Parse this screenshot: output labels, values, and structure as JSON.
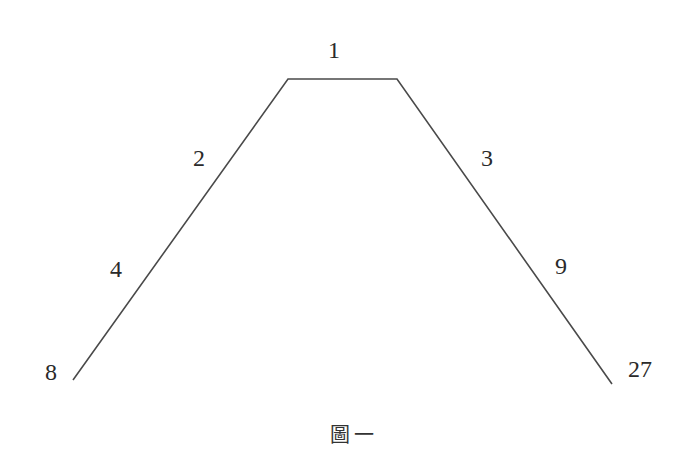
{
  "figure": {
    "caption": "圖一",
    "stroke_color": "#4a4a4a",
    "path_points": [
      [
        73,
        380
      ],
      [
        288,
        79
      ],
      [
        397,
        79
      ],
      [
        612,
        384
      ]
    ],
    "labels": {
      "top": "1",
      "left_upper": "2",
      "right_upper": "3",
      "left_middle": "4",
      "right_middle": "9",
      "left_end": "8",
      "right_end": "27"
    }
  }
}
